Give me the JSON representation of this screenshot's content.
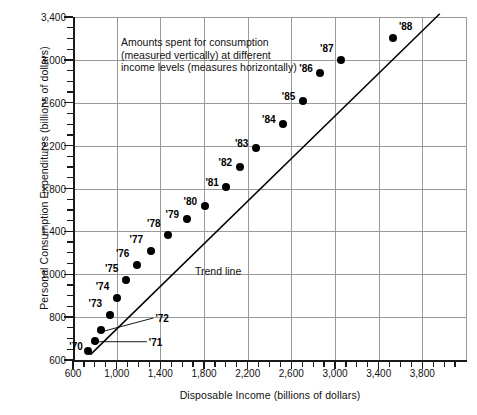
{
  "chart_data": {
    "type": "scatter",
    "title": "",
    "xlabel": "Disposable Income (billions of dollars)",
    "ylabel": "Personal Consumption Expenditures (billions of dollars)",
    "xlim": [
      600,
      4200
    ],
    "ylim": [
      600,
      3400
    ],
    "xticks": [
      "600",
      "1,000",
      "1,400",
      "1,800",
      "2,200",
      "2,600",
      "3,000",
      "3,400",
      "3,800"
    ],
    "xtick_values": [
      600,
      1000,
      1400,
      1800,
      2200,
      2600,
      3000,
      3400,
      3800
    ],
    "yticks": [
      "600",
      "800",
      "1,000",
      "1,400",
      "1,800",
      "2,200",
      "2,600",
      "3,000",
      "3,400"
    ],
    "ytick_values": [
      600,
      800,
      1000,
      1400,
      1800,
      2200,
      2600,
      3000,
      3400
    ],
    "x_minor_step": 100,
    "y_minor_step": 100,
    "grid": "both",
    "legend": "none",
    "points": [
      {
        "label": "'70",
        "x": 740,
        "y": 640,
        "label_dx": -19,
        "label_dy": -4,
        "leader": false
      },
      {
        "label": "'71",
        "x": 800,
        "y": 690,
        "label_dx": 54,
        "label_dy": 2,
        "leader": true
      },
      {
        "label": "'72",
        "x": 860,
        "y": 740,
        "label_dx": 54,
        "label_dy": -11,
        "leader": true
      },
      {
        "label": "'73",
        "x": 935,
        "y": 810,
        "label_dx": -21,
        "label_dy": -11,
        "leader": false
      },
      {
        "label": "'74",
        "x": 1000,
        "y": 890,
        "label_dx": -21,
        "label_dy": -11,
        "leader": false
      },
      {
        "label": "'75",
        "x": 1085,
        "y": 975,
        "label_dx": -21,
        "label_dy": -11,
        "leader": false
      },
      {
        "label": "'76",
        "x": 1185,
        "y": 1085,
        "label_dx": -21,
        "label_dy": -11,
        "leader": false
      },
      {
        "label": "'77",
        "x": 1310,
        "y": 1215,
        "label_dx": -21,
        "label_dy": -11,
        "leader": false
      },
      {
        "label": "'78",
        "x": 1470,
        "y": 1370,
        "label_dx": -21,
        "label_dy": -11,
        "leader": false
      },
      {
        "label": "'79",
        "x": 1640,
        "y": 1515,
        "label_dx": -21,
        "label_dy": -4,
        "leader": false
      },
      {
        "label": "'80",
        "x": 1805,
        "y": 1640,
        "label_dx": -21,
        "label_dy": -4,
        "leader": false
      },
      {
        "label": "'81",
        "x": 2005,
        "y": 1815,
        "label_dx": -21,
        "label_dy": -4,
        "leader": false
      },
      {
        "label": "'82",
        "x": 2125,
        "y": 2000,
        "label_dx": -21,
        "label_dy": -4,
        "leader": false
      },
      {
        "label": "'83",
        "x": 2275,
        "y": 2180,
        "label_dx": -21,
        "label_dy": -4,
        "leader": false
      },
      {
        "label": "'84",
        "x": 2525,
        "y": 2400,
        "label_dx": -21,
        "label_dy": -4,
        "leader": false
      },
      {
        "label": "'85",
        "x": 2705,
        "y": 2615,
        "label_dx": -21,
        "label_dy": -4,
        "leader": false
      },
      {
        "label": "'86",
        "x": 2865,
        "y": 2880,
        "label_dx": -21,
        "label_dy": -4,
        "leader": false
      },
      {
        "label": "'87",
        "x": 3055,
        "y": 3000,
        "label_dx": -21,
        "label_dy": -11,
        "leader": false
      },
      {
        "label": "'88",
        "x": 3530,
        "y": 3205,
        "label_dx": 6,
        "label_dy": -11,
        "leader": false
      }
    ],
    "trend_line": {
      "label": "Trend line",
      "x_start": 760,
      "y_start": 625,
      "x_end": 3960,
      "y_end": 3430
    },
    "annotation": "Amounts spent for consumption\n(measured vertically) at different\nincome levels (measures horizontally)"
  }
}
